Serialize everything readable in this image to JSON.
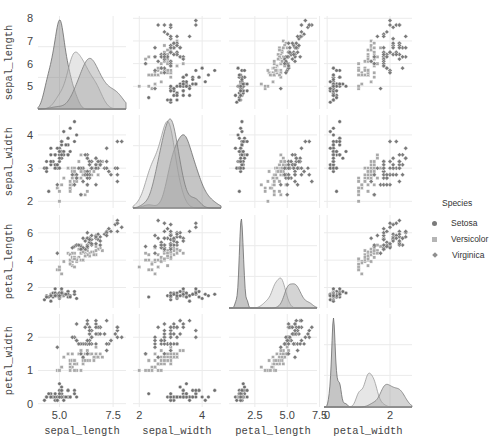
{
  "chart_data": {
    "type": "pairplot",
    "variables": [
      "sepal_length",
      "sepal_width",
      "petal_length",
      "petal_width"
    ],
    "diagonal": "kde",
    "offdiagonal": "scatter",
    "grid": true,
    "legend": {
      "title": "Species",
      "position": "right",
      "entries": [
        {
          "label": "Setosa",
          "marker": "circle",
          "color": "#7a7a7a"
        },
        {
          "label": "Versicolor",
          "marker": "square",
          "color": "#b5b5b5"
        },
        {
          "label": "Virginica",
          "marker": "diamond",
          "color": "#8f8f8f"
        }
      ]
    },
    "axes": {
      "sepal_length": {
        "range": [
          4.0,
          8.1
        ],
        "row_ticks": [
          5,
          6,
          7,
          8
        ],
        "col_ticks": [
          5.0,
          7.5
        ],
        "col_tick_labels": [
          "5.0",
          "7.5"
        ]
      },
      "sepal_width": {
        "range": [
          1.8,
          4.6
        ],
        "row_ticks": [
          2,
          3,
          4
        ],
        "col_ticks": [
          2,
          4
        ],
        "col_tick_labels": [
          "2",
          "4"
        ]
      },
      "petal_length": {
        "range": [
          0.5,
          7.3
        ],
        "row_ticks": [
          2,
          4,
          6
        ],
        "col_ticks": [
          2.5,
          5.0,
          7.5
        ],
        "col_tick_labels": [
          "2.5",
          "5.0",
          "7.5"
        ]
      },
      "petal_width": {
        "range": [
          -0.1,
          2.7
        ],
        "row_ticks": [
          0,
          1,
          2
        ],
        "col_ticks": [
          0,
          2
        ],
        "col_tick_labels": [
          "0",
          "2"
        ]
      }
    },
    "series": [
      {
        "name": "Setosa",
        "sepal_length": [
          5.1,
          4.9,
          4.7,
          4.6,
          5.0,
          5.4,
          4.6,
          5.0,
          4.4,
          4.9,
          5.4,
          4.8,
          4.8,
          4.3,
          5.8,
          5.7,
          5.4,
          5.1,
          5.7,
          5.1,
          5.4,
          5.1,
          4.6,
          5.1,
          4.8,
          5.0,
          5.0,
          5.2,
          5.2,
          4.7,
          4.8,
          5.4,
          5.2,
          5.5,
          4.9,
          5.0,
          5.5,
          4.9,
          4.4,
          5.1,
          5.0,
          4.5,
          4.4,
          5.0,
          5.1,
          4.8,
          5.1,
          4.6,
          5.3,
          5.0
        ],
        "sepal_width": [
          3.5,
          3.0,
          3.2,
          3.1,
          3.6,
          3.9,
          3.4,
          3.4,
          2.9,
          3.1,
          3.7,
          3.4,
          3.0,
          3.0,
          4.0,
          4.4,
          3.9,
          3.5,
          3.8,
          3.8,
          3.4,
          3.7,
          3.6,
          3.3,
          3.4,
          3.0,
          3.4,
          3.5,
          3.4,
          3.2,
          3.1,
          3.4,
          4.1,
          4.2,
          3.1,
          3.2,
          3.5,
          3.6,
          3.0,
          3.4,
          3.5,
          2.3,
          3.2,
          3.5,
          3.8,
          3.0,
          3.8,
          3.2,
          3.7,
          3.3
        ],
        "petal_length": [
          1.4,
          1.4,
          1.3,
          1.5,
          1.4,
          1.7,
          1.4,
          1.5,
          1.4,
          1.5,
          1.5,
          1.6,
          1.4,
          1.1,
          1.2,
          1.5,
          1.3,
          1.4,
          1.7,
          1.5,
          1.7,
          1.5,
          1.0,
          1.7,
          1.9,
          1.6,
          1.6,
          1.5,
          1.4,
          1.6,
          1.6,
          1.5,
          1.5,
          1.4,
          1.5,
          1.2,
          1.3,
          1.4,
          1.3,
          1.5,
          1.3,
          1.3,
          1.3,
          1.6,
          1.9,
          1.4,
          1.6,
          1.4,
          1.5,
          1.4
        ],
        "petal_width": [
          0.2,
          0.2,
          0.2,
          0.2,
          0.2,
          0.4,
          0.3,
          0.2,
          0.2,
          0.1,
          0.2,
          0.2,
          0.1,
          0.1,
          0.2,
          0.4,
          0.4,
          0.3,
          0.3,
          0.3,
          0.2,
          0.4,
          0.2,
          0.5,
          0.2,
          0.2,
          0.4,
          0.2,
          0.2,
          0.2,
          0.2,
          0.4,
          0.1,
          0.2,
          0.2,
          0.2,
          0.2,
          0.1,
          0.2,
          0.2,
          0.3,
          0.3,
          0.2,
          0.6,
          0.4,
          0.3,
          0.2,
          0.2,
          0.2,
          0.2
        ]
      },
      {
        "name": "Versicolor",
        "sepal_length": [
          7.0,
          6.4,
          6.9,
          5.5,
          6.5,
          5.7,
          6.3,
          4.9,
          6.6,
          5.2,
          5.0,
          5.9,
          6.0,
          6.1,
          5.6,
          6.7,
          5.6,
          5.8,
          6.2,
          5.6,
          5.9,
          6.1,
          6.3,
          6.1,
          6.4,
          6.6,
          6.8,
          6.7,
          6.0,
          5.7,
          5.5,
          5.5,
          5.8,
          6.0,
          5.4,
          6.0,
          6.7,
          6.3,
          5.6,
          5.5,
          5.5,
          6.1,
          5.8,
          5.0,
          5.6,
          5.7,
          5.7,
          6.2,
          5.1,
          5.7
        ],
        "sepal_width": [
          3.2,
          3.2,
          3.1,
          2.3,
          2.8,
          2.8,
          3.3,
          2.4,
          2.9,
          2.7,
          2.0,
          3.0,
          2.2,
          2.9,
          2.9,
          3.1,
          3.0,
          2.7,
          2.2,
          2.5,
          3.2,
          2.8,
          2.5,
          2.8,
          2.9,
          3.0,
          2.8,
          3.0,
          2.9,
          2.6,
          2.4,
          2.4,
          2.7,
          2.7,
          3.0,
          3.4,
          3.1,
          2.3,
          3.0,
          2.5,
          2.6,
          3.0,
          2.6,
          2.3,
          2.7,
          3.0,
          2.9,
          2.9,
          2.5,
          2.8
        ],
        "petal_length": [
          4.7,
          4.5,
          4.9,
          4.0,
          4.6,
          4.5,
          4.7,
          3.3,
          4.6,
          3.9,
          3.5,
          4.2,
          4.0,
          4.7,
          3.6,
          4.4,
          4.5,
          4.1,
          4.5,
          3.9,
          4.8,
          4.0,
          4.9,
          4.7,
          4.3,
          4.4,
          4.8,
          5.0,
          4.5,
          3.5,
          3.8,
          3.7,
          3.9,
          5.1,
          4.5,
          4.5,
          4.7,
          4.4,
          4.1,
          4.0,
          4.4,
          4.6,
          4.0,
          3.3,
          4.2,
          4.2,
          4.2,
          4.3,
          3.0,
          4.1
        ],
        "petal_width": [
          1.4,
          1.5,
          1.5,
          1.3,
          1.5,
          1.3,
          1.6,
          1.0,
          1.3,
          1.4,
          1.0,
          1.5,
          1.0,
          1.4,
          1.3,
          1.4,
          1.5,
          1.0,
          1.5,
          1.1,
          1.8,
          1.3,
          1.5,
          1.2,
          1.3,
          1.4,
          1.4,
          1.7,
          1.5,
          1.0,
          1.1,
          1.0,
          1.2,
          1.6,
          1.5,
          1.6,
          1.5,
          1.3,
          1.3,
          1.3,
          1.2,
          1.4,
          1.2,
          1.0,
          1.3,
          1.2,
          1.3,
          1.3,
          1.1,
          1.3
        ]
      },
      {
        "name": "Virginica",
        "sepal_length": [
          6.3,
          5.8,
          7.1,
          6.3,
          6.5,
          7.6,
          4.9,
          7.3,
          6.7,
          7.2,
          6.5,
          6.4,
          6.8,
          5.7,
          5.8,
          6.4,
          6.5,
          7.7,
          7.7,
          6.0,
          6.9,
          5.6,
          7.7,
          6.3,
          6.7,
          7.2,
          6.2,
          6.1,
          6.4,
          7.2,
          7.4,
          7.9,
          6.4,
          6.3,
          6.1,
          7.7,
          6.3,
          6.4,
          6.0,
          6.9,
          6.7,
          6.9,
          5.8,
          6.8,
          6.7,
          6.7,
          6.3,
          6.5,
          6.2,
          5.9
        ],
        "sepal_width": [
          3.3,
          2.7,
          3.0,
          2.9,
          3.0,
          3.0,
          2.5,
          2.9,
          2.5,
          3.6,
          3.2,
          2.7,
          3.0,
          2.5,
          2.8,
          3.2,
          3.0,
          3.8,
          2.6,
          2.2,
          3.2,
          2.8,
          2.8,
          2.7,
          3.3,
          3.2,
          2.8,
          3.0,
          2.8,
          3.0,
          2.8,
          3.8,
          2.8,
          2.8,
          2.6,
          3.0,
          3.4,
          3.1,
          3.0,
          3.1,
          3.1,
          3.1,
          2.7,
          3.2,
          3.3,
          3.0,
          2.5,
          3.0,
          3.4,
          3.0
        ],
        "petal_length": [
          6.0,
          5.1,
          5.9,
          5.6,
          5.8,
          6.6,
          4.5,
          6.3,
          5.8,
          6.1,
          5.1,
          5.3,
          5.5,
          5.0,
          5.1,
          5.3,
          5.5,
          6.7,
          6.9,
          5.0,
          5.7,
          4.9,
          6.7,
          4.9,
          5.7,
          6.0,
          4.8,
          4.9,
          5.6,
          5.8,
          6.1,
          6.4,
          5.6,
          5.1,
          5.6,
          6.1,
          5.6,
          5.5,
          4.8,
          5.4,
          5.6,
          5.1,
          5.1,
          5.9,
          5.7,
          5.2,
          5.0,
          5.2,
          5.4,
          5.1
        ],
        "petal_width": [
          2.5,
          1.9,
          2.1,
          1.8,
          2.2,
          2.1,
          1.7,
          1.8,
          1.8,
          2.5,
          2.0,
          1.9,
          2.1,
          2.0,
          2.4,
          2.3,
          1.8,
          2.2,
          2.3,
          1.5,
          2.3,
          2.0,
          2.0,
          1.8,
          2.1,
          1.8,
          1.8,
          1.8,
          2.1,
          1.6,
          1.9,
          2.0,
          2.2,
          1.5,
          1.4,
          2.3,
          2.4,
          1.8,
          1.8,
          2.1,
          2.4,
          2.3,
          1.9,
          2.3,
          2.5,
          2.3,
          1.9,
          2.0,
          2.3,
          1.8
        ]
      }
    ]
  },
  "style": {
    "series_fill": [
      "#7f7f7f",
      "#c8c8c8",
      "#a0a0a0"
    ],
    "series_stroke": [
      "#6a6a6a",
      "#9a9a9a",
      "#7c7c7c"
    ],
    "point_color": [
      "#6f6f6f",
      "#a8a8a8",
      "#7a7a7a"
    ],
    "grid_color": "#ebebeb",
    "text_color": "#444444"
  }
}
